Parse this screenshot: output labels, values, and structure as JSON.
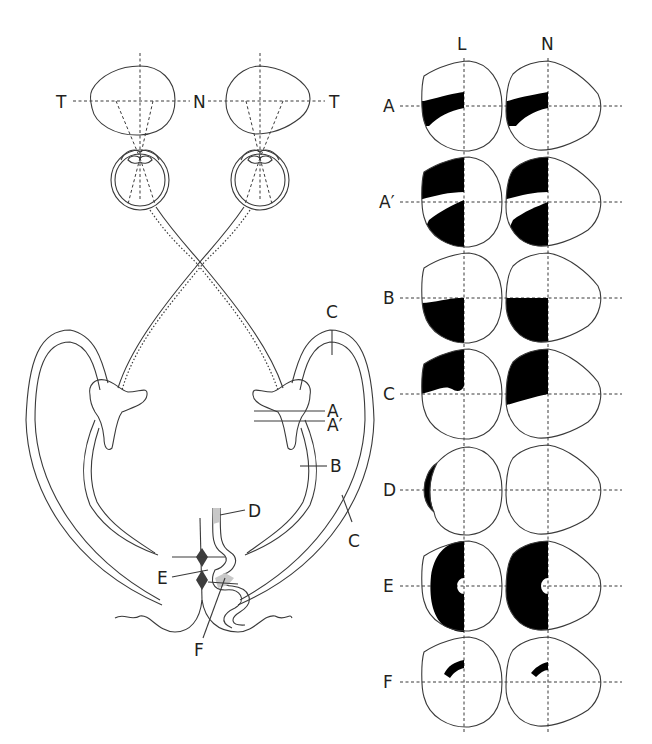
{
  "diagram": {
    "pathway_labels": {
      "temporal_left": "T",
      "nasal": "N",
      "temporal_right": "T"
    },
    "lesion_labels": {
      "A": "A",
      "A_prime": "A′",
      "B": "B",
      "C_top": "C",
      "C_side": "C",
      "D": "D",
      "E": "E",
      "F": "F"
    },
    "field_columns": [
      "L",
      "N"
    ],
    "field_rows": [
      {
        "id": "A",
        "label": "A",
        "defect": "superior wedge-shaped left temporal field loss (both eyes, homonymous)"
      },
      {
        "id": "A_prime",
        "label": "A′",
        "defect": "left homonymous hemianopia sparing a horizontal wedge"
      },
      {
        "id": "B",
        "label": "B",
        "defect": "left inferior homonymous quadrantanopia"
      },
      {
        "id": "C",
        "label": "C",
        "defect": "left superior homonymous quadrantanopia"
      },
      {
        "id": "D",
        "label": "D",
        "defect": "left temporal crescent (L eye only)"
      },
      {
        "id": "E",
        "label": "E",
        "defect": "left homonymous hemianopia with macular sparing"
      },
      {
        "id": "F",
        "label": "F",
        "defect": "small homonymous paracentral scotoma"
      }
    ],
    "colors": {
      "line": "#3a3a3a",
      "fill_defect": "#000000",
      "shade": "#c8c8c8",
      "nucleus": "#3d3d3d"
    }
  }
}
